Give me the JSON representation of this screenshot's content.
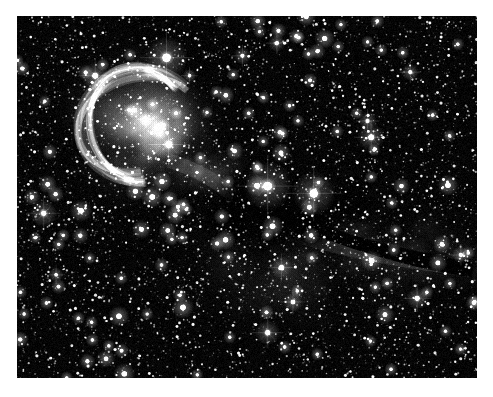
{
  "image": {
    "kind": "astrophotograph",
    "subject": "cometary globule / elephant-trunk dark nebula with bright star pair",
    "rendering": "monochrome grayscale",
    "caption": "",
    "frame": {
      "border_color": "#ffffff",
      "background_color": "#000000",
      "plate_left": 17,
      "plate_top": 16,
      "plate_width": 460,
      "plate_height": 362
    },
    "palette": {
      "sky": "#050505",
      "star": "#ffffff",
      "nebula_bright": "#b9b9b9",
      "nebula_mid": "#6e6e6e",
      "nebula_faint": "#2e2e2e",
      "dark_lane": "#000000"
    },
    "star_field": {
      "density_seed": 20250114,
      "count": 5200,
      "note": "dense uniform background star field across entire plate"
    },
    "bright_stars": [
      {
        "name": "star-top-bright",
        "x": 0.325,
        "y": 0.115,
        "size": 13,
        "glow": 34
      },
      {
        "name": "star-upper-left",
        "x": 0.17,
        "y": 0.165,
        "size": 9,
        "glow": 22
      },
      {
        "name": "star-head-core",
        "x": 0.33,
        "y": 0.355,
        "size": 10,
        "glow": 26
      },
      {
        "name": "star-head-inner",
        "x": 0.28,
        "y": 0.285,
        "size": 5,
        "glow": 12
      },
      {
        "name": "star-center-a",
        "x": 0.545,
        "y": 0.47,
        "size": 14,
        "glow": 40
      },
      {
        "name": "star-center-b",
        "x": 0.645,
        "y": 0.49,
        "size": 13,
        "glow": 36
      },
      {
        "name": "star-right-pair-a",
        "x": 0.77,
        "y": 0.335,
        "size": 9,
        "glow": 22
      },
      {
        "name": "star-right-pair-b",
        "x": 0.762,
        "y": 0.29,
        "size": 6,
        "glow": 15
      },
      {
        "name": "star-left-spiked",
        "x": 0.058,
        "y": 0.545,
        "size": 8,
        "glow": 22
      },
      {
        "name": "star-lower-mid",
        "x": 0.575,
        "y": 0.695,
        "size": 8,
        "glow": 18
      },
      {
        "name": "star-lower-a",
        "x": 0.6,
        "y": 0.79,
        "size": 7,
        "glow": 16
      },
      {
        "name": "star-bottom",
        "x": 0.545,
        "y": 0.875,
        "size": 8,
        "glow": 20
      },
      {
        "name": "star-lower-right",
        "x": 0.87,
        "y": 0.78,
        "size": 8,
        "glow": 18
      },
      {
        "name": "star-right-edge",
        "x": 0.965,
        "y": 0.66,
        "size": 6,
        "glow": 14
      },
      {
        "name": "star-upper-right",
        "x": 0.855,
        "y": 0.155,
        "size": 6,
        "glow": 14
      },
      {
        "name": "star-top-right",
        "x": 0.565,
        "y": 0.075,
        "size": 6,
        "glow": 14
      },
      {
        "name": "star-top-mid",
        "x": 0.49,
        "y": 0.11,
        "size": 6,
        "glow": 14
      },
      {
        "name": "star-upper-c",
        "x": 0.375,
        "y": 0.165,
        "size": 5,
        "glow": 11
      },
      {
        "name": "star-left-low",
        "x": 0.085,
        "y": 0.715,
        "size": 5,
        "glow": 12
      }
    ],
    "nebula_regions": [
      {
        "name": "globule-head-rim",
        "cx": 0.265,
        "cy": 0.3,
        "rx": 0.12,
        "ry": 0.145,
        "intensity": 0.55
      },
      {
        "name": "globule-head-glow",
        "cx": 0.295,
        "cy": 0.315,
        "rx": 0.07,
        "ry": 0.08,
        "intensity": 0.85
      },
      {
        "name": "globule-neck",
        "cx": 0.4,
        "cy": 0.42,
        "rx": 0.075,
        "ry": 0.06,
        "intensity": 0.45
      },
      {
        "name": "dark-lane-core",
        "cx": 0.6,
        "cy": 0.53,
        "rx": 0.15,
        "ry": 0.085,
        "intensity": -0.9
      },
      {
        "name": "tail-streamer",
        "cx": 0.73,
        "cy": 0.62,
        "rx": 0.22,
        "ry": 0.07,
        "intensity": 0.35
      },
      {
        "name": "tail-far",
        "cx": 0.9,
        "cy": 0.68,
        "rx": 0.14,
        "ry": 0.07,
        "intensity": 0.22
      },
      {
        "name": "lower-diffuse",
        "cx": 0.62,
        "cy": 0.72,
        "rx": 0.26,
        "ry": 0.13,
        "intensity": 0.16
      }
    ]
  }
}
